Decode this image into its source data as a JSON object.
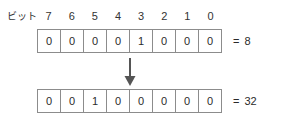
{
  "diagram": {
    "title_label": "ビット",
    "bit_indices": [
      "7",
      "6",
      "5",
      "4",
      "3",
      "2",
      "1",
      "0"
    ],
    "equals_sign": "=",
    "arrow_icon": "arrow-down-icon",
    "colors": {
      "background": "#ffffff",
      "border": "#8c8c8c",
      "text": "#2b2b2b",
      "arrow": "#555555"
    },
    "rows": [
      {
        "name": "before",
        "bits": [
          "0",
          "0",
          "0",
          "0",
          "1",
          "0",
          "0",
          "0"
        ],
        "value": "8"
      },
      {
        "name": "after",
        "bits": [
          "0",
          "0",
          "1",
          "0",
          "0",
          "0",
          "0",
          "0"
        ],
        "value": "32"
      }
    ]
  }
}
